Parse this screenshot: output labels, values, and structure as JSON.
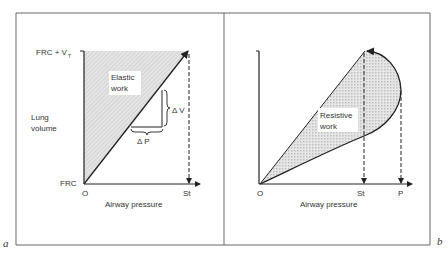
{
  "panels": [
    {
      "id": "a",
      "panel_label": "a",
      "y_axis_label_line1": "Lung",
      "y_axis_label_line2": "volume",
      "x_axis_label": "Airway pressure",
      "y_tick_top": "FRC + V",
      "y_tick_top_sub": "T",
      "y_tick_bottom": "FRC",
      "x_tick_origin": "O",
      "x_tick_st": "St",
      "area_label_line1": "Elastic",
      "area_label_line2": "work",
      "delta_v": "Δ V",
      "delta_p": "Δ P"
    },
    {
      "id": "b",
      "panel_label": "b",
      "x_axis_label": "Airway pressure",
      "x_tick_origin": "O",
      "x_tick_st": "St",
      "x_tick_p": "P",
      "area_label_line1": "Resistive",
      "area_label_line2": "work"
    }
  ],
  "colors": {
    "line": "#222222",
    "fill": "#d8d8d8",
    "frame": "#555555"
  }
}
